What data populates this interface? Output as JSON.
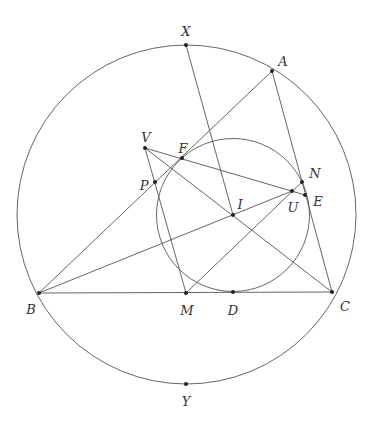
{
  "diagram": {
    "stroke_color": "#555555",
    "point_color": "#222222",
    "circles": [
      {
        "id": "circumcircle",
        "cx": 186.5,
        "cy": 214.5,
        "r": 169.5
      },
      {
        "id": "incircle",
        "cx": 233,
        "cy": 215,
        "r": 76.5
      }
    ],
    "points": [
      {
        "name": "X",
        "x": 186,
        "y": 45,
        "lx": 186,
        "ly": 32
      },
      {
        "name": "A",
        "x": 272,
        "y": 71,
        "lx": 283,
        "ly": 62
      },
      {
        "name": "V",
        "x": 145,
        "y": 148,
        "lx": 146,
        "ly": 138
      },
      {
        "name": "F",
        "x": 182,
        "y": 158,
        "lx": 183,
        "ly": 149
      },
      {
        "name": "P",
        "x": 155,
        "y": 182,
        "lx": 144,
        "ly": 186
      },
      {
        "name": "N",
        "x": 302,
        "y": 182,
        "lx": 315,
        "ly": 174
      },
      {
        "name": "U",
        "x": 292,
        "y": 191,
        "lx": 293,
        "ly": 208
      },
      {
        "name": "E",
        "x": 305,
        "y": 195,
        "lx": 318,
        "ly": 202
      },
      {
        "name": "I",
        "x": 233,
        "y": 215,
        "lx": 240,
        "ly": 205
      },
      {
        "name": "B",
        "x": 39,
        "y": 293,
        "lx": 31,
        "ly": 310
      },
      {
        "name": "M",
        "x": 186,
        "y": 293,
        "lx": 187,
        "ly": 311
      },
      {
        "name": "D",
        "x": 233,
        "y": 292,
        "lx": 233,
        "ly": 311
      },
      {
        "name": "C",
        "x": 332,
        "y": 292,
        "lx": 345,
        "ly": 307
      },
      {
        "name": "Y",
        "x": 186,
        "y": 384,
        "lx": 186,
        "ly": 402
      }
    ],
    "segments": [
      {
        "id": "AB",
        "from": "A",
        "to": "B"
      },
      {
        "id": "AC",
        "from": "A",
        "to": "C"
      },
      {
        "id": "BC",
        "from": "B",
        "to": "C"
      },
      {
        "id": "XI",
        "from": "X",
        "to": "I"
      },
      {
        "id": "VE",
        "from": "V",
        "to": "E"
      },
      {
        "id": "VC",
        "from": "V",
        "to": "C"
      },
      {
        "id": "VM",
        "from": "V",
        "to": "M"
      },
      {
        "id": "BU",
        "from": "B",
        "to": "U"
      },
      {
        "id": "MN",
        "from": "M",
        "to": "N"
      }
    ]
  }
}
